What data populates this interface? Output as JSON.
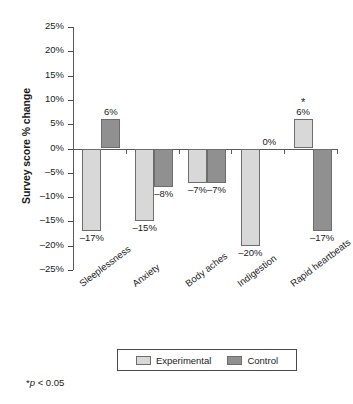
{
  "chart_data": {
    "type": "bar",
    "title": "",
    "xlabel": "",
    "ylabel": "Survey score % change",
    "ylim": [
      -25,
      25
    ],
    "ytick_step": 5,
    "grid": false,
    "legend_position": "bottom",
    "categories": [
      "Sleeplessness",
      "Anxiety",
      "Body aches",
      "Indigestion",
      "Rapid heartbeats"
    ],
    "series": [
      {
        "name": "Experimental",
        "color": "#d8d8d8",
        "values": [
          -17,
          -15,
          -7,
          -20,
          6
        ],
        "value_labels": [
          "–17%",
          "–15%",
          "–7%",
          "–20%",
          "6%"
        ],
        "significant": [
          false,
          false,
          false,
          false,
          true
        ]
      },
      {
        "name": "Control",
        "color": "#909090",
        "values": [
          6,
          -8,
          -7,
          0,
          -17
        ],
        "value_labels": [
          "6%",
          "–8%",
          "–7%",
          "0%",
          "–17%"
        ],
        "significant": [
          false,
          false,
          false,
          false,
          false
        ]
      }
    ],
    "y_tick_labels": [
      "25%",
      "20%",
      "15%",
      "10%",
      "5%",
      "0%",
      "–5%",
      "–10%",
      "–15%",
      "–20%",
      "–25%"
    ],
    "y_tick_values": [
      25,
      20,
      15,
      10,
      5,
      0,
      -5,
      -10,
      -15,
      -20,
      -25
    ],
    "annotations": {
      "significance_marker": "*",
      "footnote_marker": "*",
      "footnote_italic": "p",
      "footnote_rest": " < 0.05"
    }
  },
  "legend": {
    "entries": [
      {
        "label": "Experimental",
        "swatch": "experimental"
      },
      {
        "label": "Control",
        "swatch": "control"
      }
    ]
  }
}
